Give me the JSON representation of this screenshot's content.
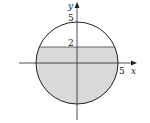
{
  "diagram": {
    "title": "",
    "axes": {
      "x_label": "x",
      "y_label": "y",
      "x_tick_label": "5",
      "y_tick_label_top": "5",
      "y_tick_label_line": "2"
    },
    "circle": {
      "center": [
        0,
        0
      ],
      "radius": 5
    },
    "shaded_region": {
      "description": "part of disk below y = 2",
      "upper_bound_y": 2,
      "fill": "#d9d9d9"
    },
    "colors": {
      "stroke": "#222222",
      "fill": "#d9d9d9",
      "background": "#ffffff"
    }
  }
}
